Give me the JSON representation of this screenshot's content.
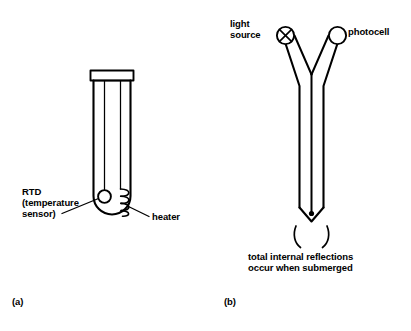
{
  "figure": {
    "background_color": "#ffffff",
    "ink_color": "#000000",
    "panels": [
      {
        "id": "a",
        "caption": "(a)",
        "title": "heated RTD level probe",
        "annotations": [
          {
            "name": "rtd-label",
            "lines": [
              "RTD",
              "(temperature",
              "sensor)"
            ],
            "text": "RTD (temperature sensor)"
          },
          {
            "name": "heater-label",
            "lines": [
              "heater"
            ],
            "text": "heater"
          }
        ],
        "components": [
          {
            "name": "probe-body",
            "shape": "tube-with-rounded-tip"
          },
          {
            "name": "probe-cap",
            "shape": "rectangle"
          },
          {
            "name": "rtd-sensor",
            "shape": "circle"
          },
          {
            "name": "heater-coil",
            "shape": "coil",
            "turns": 4
          }
        ]
      },
      {
        "id": "b",
        "caption": "(b)",
        "title": "optical (total internal reflection) level probe",
        "annotations": [
          {
            "name": "light-source-label",
            "lines": [
              "light",
              "source"
            ],
            "text": "light source"
          },
          {
            "name": "photocell-label",
            "lines": [
              "photocell"
            ],
            "text": "photocell"
          },
          {
            "name": "reflection-caption",
            "lines": [
              "total internal reflections",
              "occur when submerged"
            ],
            "text": "total internal reflections occur when submerged"
          }
        ],
        "components": [
          {
            "name": "light-source-symbol",
            "shape": "circle-with-x"
          },
          {
            "name": "photocell-symbol",
            "shape": "circle"
          },
          {
            "name": "optical-probe-body",
            "shape": "y-shaped-fiber"
          },
          {
            "name": "prism-tip",
            "shape": "chevron-point"
          },
          {
            "name": "prism-tip-dot",
            "shape": "filled-dot"
          },
          {
            "name": "liquid-surface-arcs",
            "shape": "two-arcs"
          }
        ]
      }
    ]
  }
}
